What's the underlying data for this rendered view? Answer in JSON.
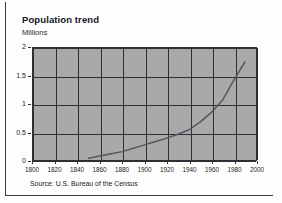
{
  "figure": {
    "title": "Population trend",
    "subtitle": "Millions",
    "source": "Source: U.S. Bureau of the Census",
    "plot_background_color": "#a9a9a9",
    "line_color": "#555560",
    "axis_color": "#2e2e34"
  },
  "chart_data": {
    "type": "line",
    "title": "Population trend",
    "subtitle": "Millions",
    "xlabel": "",
    "ylabel": "Millions",
    "xlim": [
      1800,
      2000
    ],
    "ylim": [
      0,
      2
    ],
    "xticks": [
      1800,
      1820,
      1840,
      1860,
      1880,
      1900,
      1920,
      1940,
      1960,
      1980,
      2000
    ],
    "yticks": [
      0,
      0.5,
      1,
      1.5,
      2
    ],
    "ytick_labels": [
      "0",
      "0.5",
      "1",
      "1.5",
      "2"
    ],
    "xtick_labels": [
      "1800",
      "1820",
      "1840",
      "1860",
      "1880",
      "1900",
      "1920",
      "1940",
      "1960",
      "1980",
      "2000"
    ],
    "grid": true,
    "legend": false,
    "annotation": "Source: U.S. Bureau of the Census",
    "series": [
      {
        "name": "Population",
        "x": [
          1850,
          1860,
          1870,
          1880,
          1890,
          1900,
          1910,
          1920,
          1930,
          1940,
          1950,
          1960,
          1970,
          1980,
          1990
        ],
        "values": [
          0.03,
          0.07,
          0.11,
          0.15,
          0.21,
          0.27,
          0.33,
          0.39,
          0.46,
          0.54,
          0.68,
          0.85,
          1.07,
          1.42,
          1.75
        ]
      }
    ]
  }
}
